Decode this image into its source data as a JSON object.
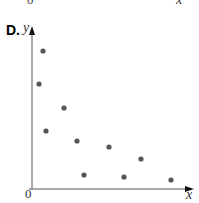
{
  "previous": {
    "origin": "0",
    "x_label": "x"
  },
  "option_label": "D.",
  "chart_data": {
    "type": "scatter",
    "title": "",
    "xlabel": "x",
    "ylabel": "y",
    "origin_label": "0",
    "grid": false,
    "point_color": "#555555",
    "points_px": [
      [
        43,
        51
      ],
      [
        39,
        84
      ],
      [
        64,
        108
      ],
      [
        46,
        131
      ],
      [
        77,
        141
      ],
      [
        109,
        147
      ],
      [
        141,
        159
      ],
      [
        84,
        175
      ],
      [
        124,
        177
      ],
      [
        171,
        180
      ]
    ]
  }
}
